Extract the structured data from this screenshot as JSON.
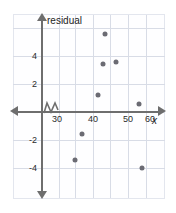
{
  "chart_data": {
    "type": "scatter",
    "title": "",
    "xlabel": "x",
    "ylabel": "residual",
    "xlim": [
      25,
      63
    ],
    "ylim": [
      -5,
      5.6
    ],
    "grid": true,
    "legend": null,
    "axis_break_x": true,
    "x_ticks": [
      {
        "value": 30,
        "label": "30"
      },
      {
        "value": 40,
        "label": "40"
      },
      {
        "value": 50,
        "label": "50"
      },
      {
        "value": 60,
        "label": "60"
      }
    ],
    "y_ticks": [
      {
        "value": 4,
        "label": "4"
      },
      {
        "value": 2,
        "label": "2"
      },
      {
        "value": -2,
        "label": "-2"
      },
      {
        "value": -4,
        "label": "-4"
      }
    ],
    "points": [
      {
        "x": 43.5,
        "y": 5.6
      },
      {
        "x": 43.0,
        "y": 3.4
      },
      {
        "x": 46.5,
        "y": 3.6
      },
      {
        "x": 41.5,
        "y": 1.2
      },
      {
        "x": 53.0,
        "y": 0.6
      },
      {
        "x": 37.0,
        "y": -1.6
      },
      {
        "x": 35.0,
        "y": -3.4
      },
      {
        "x": 54.0,
        "y": -4.0
      }
    ],
    "point_color": "#6b6b73",
    "axis_color": "#6e6e6e",
    "grid_color": "#d8dce6"
  }
}
